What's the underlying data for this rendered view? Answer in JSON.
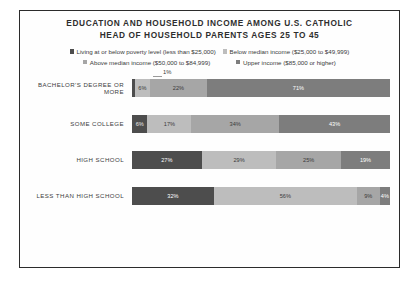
{
  "chart": {
    "title_line1": "EDUCATION AND HOUSEHOLD INCOME AMONG U.S. CATHOLIC",
    "title_line2": "HEAD OF HOUSEHOLD PARENTS AGES 25 TO 45",
    "callout_label": "1%"
  },
  "legend": [
    {
      "label": "Living at or below poverty level (less than $25,000)",
      "color": "#4d4d4d"
    },
    {
      "label": "Below median income ($25,000 to $49,999)",
      "color": "#bdbdbd"
    },
    {
      "label": "Above median income ($50,000 to $84,999)",
      "color": "#a6a6a6"
    },
    {
      "label": "Upper income ($85,000 or higher)",
      "color": "#7d7d7d"
    }
  ],
  "chart_data": {
    "type": "bar",
    "orientation": "horizontal",
    "stacked": true,
    "stack_total": 100,
    "title": "EDUCATION AND HOUSEHOLD INCOME AMONG U.S. CATHOLIC HEAD OF HOUSEHOLD PARENTS AGES 25 TO 45",
    "xlabel": "",
    "ylabel": "",
    "xlim": [
      0,
      100
    ],
    "grid": false,
    "legend_position": "top",
    "categories": [
      "BACHELOR'S DEGREE OR MORE",
      "SOME COLLEGE",
      "HIGH SCHOOL",
      "LESS THAN HIGH SCHOOL"
    ],
    "series": [
      {
        "name": "Living at or below poverty level (less than $25,000)",
        "color": "#4d4d4d",
        "values": [
          1,
          6,
          27,
          32
        ]
      },
      {
        "name": "Below median income ($25,000 to $49,999)",
        "color": "#bdbdbd",
        "values": [
          6,
          17,
          29,
          56
        ]
      },
      {
        "name": "Above median income ($50,000 to $84,999)",
        "color": "#a6a6a6",
        "values": [
          22,
          34,
          25,
          9
        ]
      },
      {
        "name": "Upper income ($85,000 or higher)",
        "color": "#7d7d7d",
        "values": [
          71,
          43,
          19,
          4
        ]
      }
    ],
    "rows": [
      {
        "category": "BACHELOR'S DEGREE OR MORE",
        "segments": [
          {
            "value": 1,
            "label": "1%",
            "color": "#4d4d4d",
            "label_color": "#3a3a3a",
            "label_placement": "callout"
          },
          {
            "value": 6,
            "label": "6%",
            "color": "#bdbdbd",
            "label_color": "#3a3a3a",
            "label_placement": "inside"
          },
          {
            "value": 22,
            "label": "22%",
            "color": "#a6a6a6",
            "label_color": "#3a3a3a",
            "label_placement": "inside"
          },
          {
            "value": 71,
            "label": "71%",
            "color": "#7d7d7d",
            "label_color": "#ffffff",
            "label_placement": "inside"
          }
        ]
      },
      {
        "category": "SOME COLLEGE",
        "segments": [
          {
            "value": 6,
            "label": "6%",
            "color": "#4d4d4d",
            "label_color": "#e8e8e8",
            "label_placement": "inside"
          },
          {
            "value": 17,
            "label": "17%",
            "color": "#bdbdbd",
            "label_color": "#3a3a3a",
            "label_placement": "inside"
          },
          {
            "value": 34,
            "label": "34%",
            "color": "#a6a6a6",
            "label_color": "#3a3a3a",
            "label_placement": "inside"
          },
          {
            "value": 43,
            "label": "43%",
            "color": "#7d7d7d",
            "label_color": "#ffffff",
            "label_placement": "inside"
          }
        ]
      },
      {
        "category": "HIGH SCHOOL",
        "segments": [
          {
            "value": 27,
            "label": "27%",
            "color": "#4d4d4d",
            "label_color": "#ffffff",
            "label_placement": "inside"
          },
          {
            "value": 29,
            "label": "29%",
            "color": "#bdbdbd",
            "label_color": "#3a3a3a",
            "label_placement": "inside"
          },
          {
            "value": 25,
            "label": "25%",
            "color": "#a6a6a6",
            "label_color": "#3a3a3a",
            "label_placement": "inside"
          },
          {
            "value": 19,
            "label": "19%",
            "color": "#7d7d7d",
            "label_color": "#ffffff",
            "label_placement": "inside"
          }
        ]
      },
      {
        "category": "LESS THAN HIGH SCHOOL",
        "segments": [
          {
            "value": 32,
            "label": "32%",
            "color": "#4d4d4d",
            "label_color": "#ffffff",
            "label_placement": "inside"
          },
          {
            "value": 56,
            "label": "56%",
            "color": "#bdbdbd",
            "label_color": "#3a3a3a",
            "label_placement": "inside"
          },
          {
            "value": 9,
            "label": "9%",
            "color": "#a6a6a6",
            "label_color": "#3a3a3a",
            "label_placement": "inside"
          },
          {
            "value": 4,
            "label": "4%",
            "color": "#7d7d7d",
            "label_color": "#ffffff",
            "label_placement": "inside"
          }
        ]
      }
    ]
  }
}
